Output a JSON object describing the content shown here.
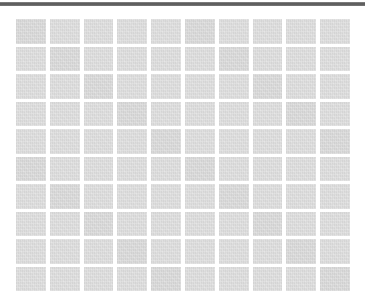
{
  "page": {
    "background_color": "#ffffff",
    "top_rule_color": "#555555"
  },
  "grid": {
    "rows": 10,
    "columns": 10,
    "tile_color": "#dcdcdc",
    "gap_color": "#ffffff"
  }
}
